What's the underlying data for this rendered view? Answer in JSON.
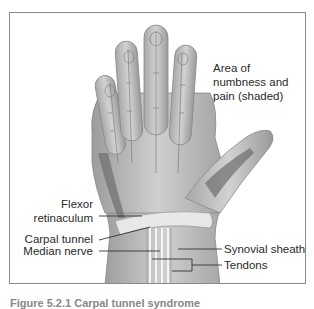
{
  "figure": {
    "labels": {
      "area_numbness": [
        "Area of",
        "numbness and",
        "pain (shaded)"
      ],
      "flexor_retinaculum": [
        "Flexor",
        "retinaculum"
      ],
      "carpal_tunnel": "Carpal tunnel",
      "median_nerve": "Median nerve",
      "synovial_sheath": "Synovial sheath",
      "tendons": "Tendons"
    },
    "caption": "Figure 5.2.1   Carpal tunnel syndrome",
    "colors": {
      "border": "#8a8a8a",
      "text": "#2a2a2a",
      "hand_light": "#d6d6d6",
      "hand_mid": "#b0b0b0",
      "hand_dark": "#6e6e6e",
      "leader_line": "#333333"
    }
  }
}
